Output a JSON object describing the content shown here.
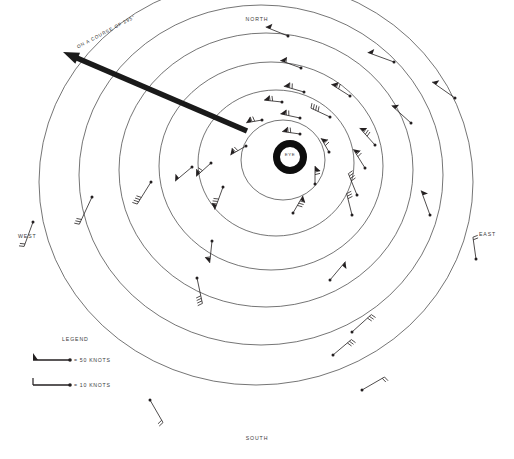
{
  "figure": {
    "kind": "hurricane-wind-field-diagram",
    "eye_label": "EYE",
    "course_label": "ON A COURSE OF 295°"
  },
  "cardinals": {
    "north": "NORTH",
    "south": "SOUTH",
    "east": "EAST",
    "west": "WEST"
  },
  "legend": {
    "title": "LEGEND",
    "items": [
      {
        "symbol": "pennant-flag-barb",
        "label": "= 50 KNOTS"
      },
      {
        "symbol": "full-barb",
        "label": "= 10 KNOTS"
      }
    ]
  },
  "footer": {
    "caption": ""
  },
  "colors": {
    "ink": "#231f20",
    "ring_stroke": "#3a3a3a",
    "arrow": "#1a1a1a",
    "background": "#ffffff",
    "label": "#3a3a3a"
  },
  "chart_data": {
    "type": "scatter",
    "xlabel": "",
    "ylabel": "",
    "grid": false,
    "legend_position": "lower-left",
    "center": {
      "x": 290,
      "y": 157,
      "eye_outer_radius": 17,
      "eye_inner_radius": 10
    },
    "rings": [
      {
        "index": 1,
        "cx": 283,
        "cy": 160,
        "rx": 42,
        "ry": 40
      },
      {
        "index": 2,
        "cx": 276,
        "cy": 163,
        "rx": 78,
        "ry": 73
      },
      {
        "index": 3,
        "cx": 271,
        "cy": 166,
        "rx": 112,
        "ry": 104
      },
      {
        "index": 4,
        "cx": 266,
        "cy": 170,
        "rx": 147,
        "ry": 137
      },
      {
        "index": 5,
        "cx": 261,
        "cy": 175,
        "rx": 182,
        "ry": 170
      },
      {
        "index": 6,
        "cx": 256,
        "cy": 182,
        "rx": 217,
        "ry": 203
      }
    ],
    "motion_arrow": {
      "from_x": 247,
      "from_y": 131,
      "to_x": 63,
      "to_y": 52,
      "bearing_degrees": 295,
      "label": "ON A COURSE OF 295°"
    },
    "barbs": [
      {
        "x": 288,
        "y": 36,
        "angle": 202,
        "len": 24,
        "flags": 1,
        "barbs": 0
      },
      {
        "x": 301,
        "y": 68,
        "angle": 200,
        "len": 22,
        "flags": 1,
        "barbs": 1
      },
      {
        "x": 304,
        "y": 92,
        "angle": 196,
        "len": 21,
        "flags": 1,
        "barbs": 2
      },
      {
        "x": 300,
        "y": 118,
        "angle": 192,
        "len": 20,
        "flags": 1,
        "barbs": 2
      },
      {
        "x": 300,
        "y": 134,
        "angle": 188,
        "len": 18,
        "flags": 1,
        "barbs": 2
      },
      {
        "x": 330,
        "y": 117,
        "angle": 205,
        "len": 21,
        "flags": 0,
        "barbs": 4
      },
      {
        "x": 350,
        "y": 96,
        "angle": 212,
        "len": 22,
        "flags": 1,
        "barbs": 2
      },
      {
        "x": 375,
        "y": 145,
        "angle": 228,
        "len": 23,
        "flags": 1,
        "barbs": 3
      },
      {
        "x": 365,
        "y": 168,
        "angle": 238,
        "len": 22,
        "flags": 1,
        "barbs": 2
      },
      {
        "x": 357,
        "y": 195,
        "angle": 248,
        "len": 23,
        "flags": 0,
        "barbs": 4
      },
      {
        "x": 352,
        "y": 215,
        "angle": 256,
        "len": 22,
        "flags": 0,
        "barbs": 3
      },
      {
        "x": 394,
        "y": 62,
        "angle": 200,
        "len": 28,
        "flags": 1,
        "barbs": 0
      },
      {
        "x": 455,
        "y": 98,
        "angle": 215,
        "len": 28,
        "flags": 1,
        "barbs": 0
      },
      {
        "x": 411,
        "y": 123,
        "angle": 222,
        "len": 26,
        "flags": 1,
        "barbs": 0
      },
      {
        "x": 430,
        "y": 215,
        "angle": 250,
        "len": 26,
        "flags": 1,
        "barbs": 0
      },
      {
        "x": 476,
        "y": 259,
        "angle": 262,
        "len": 22,
        "flags": 0,
        "barbs": 2
      },
      {
        "x": 329,
        "y": 152,
        "angle": 240,
        "len": 16,
        "flags": 1,
        "barbs": 2
      },
      {
        "x": 315,
        "y": 184,
        "angle": 270,
        "len": 18,
        "flags": 1,
        "barbs": 2
      },
      {
        "x": 293,
        "y": 213,
        "angle": 300,
        "len": 20,
        "flags": 1,
        "barbs": 3
      },
      {
        "x": 246,
        "y": 146,
        "angle": 150,
        "len": 18,
        "flags": 1,
        "barbs": 2
      },
      {
        "x": 211,
        "y": 163,
        "angle": 138,
        "len": 20,
        "flags": 1,
        "barbs": 2
      },
      {
        "x": 223,
        "y": 187,
        "angle": 110,
        "len": 24,
        "flags": 1,
        "barbs": 3
      },
      {
        "x": 212,
        "y": 241,
        "angle": 96,
        "len": 22,
        "flags": 1,
        "barbs": 1
      },
      {
        "x": 192,
        "y": 167,
        "angle": 140,
        "len": 22,
        "flags": 1,
        "barbs": 0
      },
      {
        "x": 151,
        "y": 182,
        "angle": 122,
        "len": 26,
        "flags": 0,
        "barbs": 4
      },
      {
        "x": 92,
        "y": 197,
        "angle": 115,
        "len": 30,
        "flags": 0,
        "barbs": 3
      },
      {
        "x": 33,
        "y": 222,
        "angle": 110,
        "len": 26,
        "flags": 0,
        "barbs": 2
      },
      {
        "x": 197,
        "y": 278,
        "angle": 78,
        "len": 26,
        "flags": 0,
        "barbs": 4
      },
      {
        "x": 330,
        "y": 280,
        "angle": 310,
        "len": 24,
        "flags": 1,
        "barbs": 0
      },
      {
        "x": 352,
        "y": 332,
        "angle": 318,
        "len": 26,
        "flags": 0,
        "barbs": 3
      },
      {
        "x": 333,
        "y": 355,
        "angle": 320,
        "len": 24,
        "flags": 0,
        "barbs": 3
      },
      {
        "x": 150,
        "y": 400,
        "angle": 60,
        "len": 26,
        "flags": 0,
        "barbs": 2
      },
      {
        "x": 362,
        "y": 390,
        "angle": 330,
        "len": 26,
        "flags": 0,
        "barbs": 2
      },
      {
        "x": 282,
        "y": 102,
        "angle": 186,
        "len": 18,
        "flags": 1,
        "barbs": 2
      },
      {
        "x": 262,
        "y": 120,
        "angle": 170,
        "len": 16,
        "flags": 1,
        "barbs": 2
      }
    ]
  }
}
